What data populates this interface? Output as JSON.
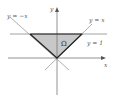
{
  "figure": {
    "labels": {
      "y_axis": "y",
      "x_axis": "x",
      "line_neg": "y = −x",
      "line_pos": "y = x",
      "line_h": "y = 1",
      "region": "Ω"
    },
    "colors": {
      "region_fill": "#c8c8c8",
      "boundary": "#222222",
      "axes": "#777777",
      "thin_lines": "#9a9a9a"
    }
  }
}
